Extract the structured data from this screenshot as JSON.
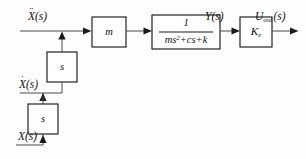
{
  "diagram": {
    "type": "control-block-diagram",
    "canvas": {
      "width": 306,
      "height": 159
    },
    "background_color": "#fdfdfd",
    "line_color": "#4a4a4a",
    "box_stroke_color": "#1a1a1a",
    "text_color": "#111111",
    "blocks": [
      {
        "id": "mass",
        "label": "m",
        "x": 92,
        "y": 17,
        "w": 34,
        "h": 30
      },
      {
        "id": "transfer-function",
        "numerator": "1",
        "denominator_ms2": "ms",
        "denominator_exp": "2",
        "denominator_rest": "+cs+k",
        "x": 152,
        "y": 15,
        "w": 68,
        "h": 34
      },
      {
        "id": "gain",
        "label_base": "K",
        "label_sub": "e",
        "x": 240,
        "y": 17,
        "w": 32,
        "h": 30
      },
      {
        "id": "integrator-upper",
        "label": "s",
        "x": 47,
        "y": 52,
        "w": 30,
        "h": 30
      },
      {
        "id": "integrator-lower",
        "label": "s",
        "x": 28,
        "y": 104,
        "w": 30,
        "h": 30
      }
    ],
    "signals": [
      {
        "id": "input-acceleration",
        "base": "X",
        "dots": "¨",
        "arg": "(s)",
        "order": 2,
        "x": 28,
        "y": 10
      },
      {
        "id": "velocity",
        "base": "X",
        "dots": "˙",
        "arg": "(s)",
        "order": 1,
        "x": 19,
        "y": 80
      },
      {
        "id": "displacement",
        "base": "X",
        "dots": "",
        "arg": "(s)",
        "order": 0,
        "x": 18,
        "y": 132
      },
      {
        "id": "force-output",
        "base": "Y",
        "dots": "",
        "arg": "(s)",
        "order": 0,
        "x": 205,
        "y": 10
      },
      {
        "id": "voltage-output",
        "base": "U",
        "subscript": "out",
        "dots": "",
        "arg": "(s)",
        "order": 0,
        "x": 256,
        "y": 10
      }
    ]
  }
}
